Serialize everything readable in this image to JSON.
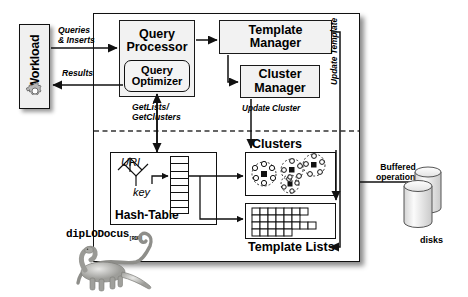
{
  "diagram": {
    "brand": {
      "name": "dipLODocus",
      "subscript": "[RDF]",
      "mascot": "diplodocus-dinosaur"
    },
    "colors": {
      "stroke": "#1a1a1a",
      "box_fill": "#f2f2f2",
      "panel_fill": "#ffffff",
      "background": "#ffffff"
    }
  },
  "external": {
    "workload": {
      "label": "Workload",
      "icon": "gear-icon"
    },
    "storage": {
      "label": "disks",
      "icon": "database-cylinder-icon",
      "annotation": "Buffered operations"
    }
  },
  "components": {
    "query_processor": {
      "line1": "Query",
      "line2": "Processor"
    },
    "query_optimizer": {
      "line1": "Query",
      "line2": "Optimizer"
    },
    "template_manager": {
      "line1": "Template",
      "line2": "Manager"
    },
    "cluster_manager": {
      "line1": "Cluster",
      "line2": "Manager"
    },
    "hash_table": {
      "caption": "Hash-Table",
      "input_label": "URI",
      "output_label": "key",
      "icon": "hash-funnel-icon",
      "bucket_count": 8
    },
    "clusters": {
      "caption": "Clusters",
      "glyph_count": 4,
      "icon": "cluster-molecule-icon"
    },
    "template_lists": {
      "caption": "Template Lists",
      "row_lengths": [
        7,
        6,
        8,
        5
      ],
      "icon": "grid-rows-icon"
    }
  },
  "flows": {
    "queries_inserts": "Queries\n& Inserts",
    "results": "Results",
    "get_lists_clusters": "GetLists/\nGetClusters",
    "update_cluster": "Update Cluster",
    "update_template": "Update Template",
    "buffered_operations": "Buffered\noperations"
  }
}
